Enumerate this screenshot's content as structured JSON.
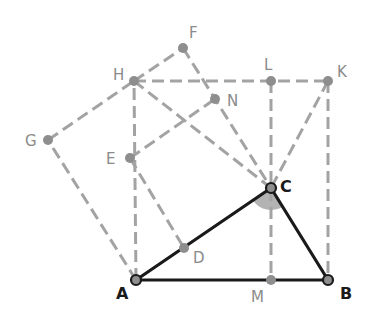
{
  "diagram": {
    "colors": {
      "construction": "#a3a3a3",
      "triangle": "#1a1a1a",
      "point_fill": "#8e8e8e",
      "label_gray": "#8a8a8a",
      "label_main": "#1a1a1a",
      "angle_fill": "#b3b3b3"
    },
    "points": {
      "A": {
        "label": "A",
        "x": 136,
        "y": 280
      },
      "B": {
        "label": "B",
        "x": 328,
        "y": 280
      },
      "C": {
        "label": "C",
        "x": 271,
        "y": 188
      },
      "D": {
        "label": "D",
        "x": 184,
        "y": 248
      },
      "E": {
        "label": "E",
        "x": 130,
        "y": 158
      },
      "F": {
        "label": "F",
        "x": 183,
        "y": 48
      },
      "G": {
        "label": "G",
        "x": 48,
        "y": 140
      },
      "H": {
        "label": "H",
        "x": 134,
        "y": 81
      },
      "K": {
        "label": "K",
        "x": 328,
        "y": 81
      },
      "L": {
        "label": "L",
        "x": 271,
        "y": 81
      },
      "M": {
        "label": "M",
        "x": 271,
        "y": 280
      },
      "N": {
        "label": "N",
        "x": 215,
        "y": 99
      }
    },
    "solid_segments": [
      "A-B",
      "B-C",
      "C-A"
    ],
    "dashed_segments": [
      "A-G",
      "G-H",
      "H-F",
      "F-C",
      "H-K",
      "A-H",
      "K-B",
      "L-M",
      "H-C",
      "K-C",
      "E-N",
      "E-D",
      "N-C"
    ],
    "angle_marker": {
      "vertex": "C",
      "between": [
        "A",
        "B"
      ],
      "style": "filled-sector"
    }
  }
}
